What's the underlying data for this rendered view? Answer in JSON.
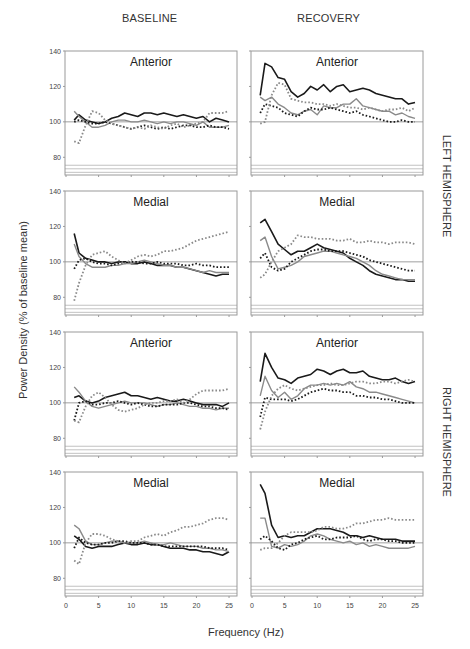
{
  "labels": {
    "col_baseline": "BASELINE",
    "col_recovery": "RECOVERY",
    "ylabel": "Power Density (% of baseline mean)",
    "xlabel": "Frequency (Hz)",
    "hemi_left": "LEFT HEMISPHERE",
    "hemi_right": "RIGHT HEMISPHERE"
  },
  "axes": {
    "y_ticks": [
      80,
      100,
      120,
      140
    ],
    "x_ticks": [
      0,
      5,
      10,
      15,
      20,
      25
    ],
    "ylim": [
      70,
      140
    ],
    "xlim": [
      0,
      26
    ],
    "reference_line": 100
  },
  "style": {
    "black": "#1a1a1a",
    "gray": "#8a8a8a",
    "frame": "#9a9a9a"
  },
  "chart_data": {
    "type": "line",
    "title": "",
    "xlabel": "Frequency (Hz)",
    "ylabel": "Power Density (% of baseline mean)",
    "ylim": [
      70,
      140
    ],
    "x": [
      1.25,
      2,
      3,
      4,
      5,
      6,
      7,
      8,
      9,
      10,
      11,
      12,
      13,
      14,
      15,
      16,
      17,
      18,
      19,
      20,
      21,
      22,
      23,
      24,
      25
    ],
    "series_styles": [
      {
        "name": "black-solid",
        "color": "#1a1a1a",
        "dash": false,
        "width": 1.6
      },
      {
        "name": "gray-solid",
        "color": "#8a8a8a",
        "dash": false,
        "width": 1.4
      },
      {
        "name": "black-dotted",
        "color": "#1a1a1a",
        "dash": true,
        "width": 1.8
      },
      {
        "name": "gray-dotted",
        "color": "#8a8a8a",
        "dash": true,
        "width": 1.8
      }
    ],
    "panels": [
      {
        "title": "Anterior",
        "hemisphere": "LEFT HEMISPHERE",
        "condition": "BASELINE",
        "series": [
          [
            101,
            104,
            101,
            100,
            99,
            100,
            102,
            103,
            105,
            104,
            103,
            105,
            105,
            104,
            105,
            104,
            103,
            104,
            103,
            102,
            103,
            100,
            102,
            101,
            100
          ],
          [
            106,
            103,
            100,
            97,
            97,
            98,
            100,
            101,
            101,
            100,
            100,
            101,
            100,
            99,
            100,
            99,
            100,
            100,
            99,
            98,
            100,
            97,
            97,
            97,
            98
          ],
          [
            100,
            101,
            100,
            99,
            99,
            100,
            99,
            98,
            97,
            96,
            97,
            98,
            97,
            96,
            97,
            96,
            97,
            98,
            98,
            97,
            97,
            98,
            97,
            97,
            96
          ],
          [
            89,
            88,
            98,
            106,
            105,
            101,
            99,
            98,
            97,
            96,
            97,
            96,
            98,
            97,
            96,
            98,
            99,
            97,
            98,
            99,
            100,
            105,
            105,
            105,
            106
          ]
        ]
      },
      {
        "title": "Anterior",
        "hemisphere": "LEFT HEMISPHERE",
        "condition": "RECOVERY",
        "series": [
          [
            115,
            133,
            131,
            125,
            124,
            117,
            114,
            116,
            120,
            118,
            121,
            117,
            120,
            121,
            117,
            118,
            119,
            118,
            116,
            115,
            114,
            113,
            113,
            110,
            111
          ],
          [
            114,
            112,
            114,
            110,
            108,
            105,
            104,
            106,
            107,
            104,
            109,
            108,
            108,
            110,
            110,
            113,
            109,
            108,
            107,
            106,
            106,
            104,
            105,
            103,
            102
          ],
          [
            105,
            110,
            109,
            108,
            105,
            104,
            103,
            106,
            108,
            107,
            107,
            108,
            107,
            106,
            105,
            106,
            104,
            103,
            102,
            101,
            100,
            100,
            101,
            100,
            100
          ],
          [
            99,
            100,
            115,
            122,
            121,
            113,
            112,
            111,
            111,
            110,
            110,
            109,
            110,
            109,
            108,
            108,
            107,
            108,
            107,
            106,
            107,
            107,
            108,
            106,
            108
          ]
        ]
      },
      {
        "title": "Medial",
        "hemisphere": "LEFT HEMISPHERE",
        "condition": "BASELINE",
        "series": [
          [
            116,
            105,
            102,
            101,
            100,
            100,
            99,
            100,
            100,
            99,
            99,
            100,
            99,
            98,
            98,
            98,
            97,
            97,
            96,
            95,
            94,
            93,
            92,
            93,
            93
          ],
          [
            110,
            103,
            99,
            97,
            97,
            97,
            98,
            98,
            99,
            99,
            100,
            101,
            100,
            99,
            98,
            98,
            97,
            97,
            96,
            95,
            94,
            95,
            94,
            94,
            94
          ],
          [
            96,
            101,
            102,
            100,
            99,
            99,
            98,
            99,
            100,
            100,
            100,
            99,
            99,
            100,
            99,
            99,
            99,
            98,
            98,
            99,
            98,
            98,
            97,
            97,
            97
          ],
          [
            78,
            88,
            98,
            104,
            105,
            106,
            103,
            101,
            99,
            101,
            103,
            104,
            103,
            104,
            106,
            106,
            107,
            108,
            110,
            112,
            113,
            114,
            115,
            116,
            117
          ]
        ]
      },
      {
        "title": "Medial",
        "hemisphere": "LEFT HEMISPHERE",
        "condition": "RECOVERY",
        "series": [
          [
            122,
            124,
            117,
            110,
            107,
            104,
            106,
            106,
            108,
            110,
            108,
            107,
            106,
            105,
            102,
            100,
            98,
            95,
            93,
            92,
            91,
            90,
            90,
            89,
            89
          ],
          [
            112,
            114,
            103,
            96,
            97,
            98,
            100,
            103,
            104,
            105,
            106,
            106,
            105,
            104,
            103,
            102,
            100,
            98,
            95,
            93,
            92,
            91,
            90,
            90,
            90
          ],
          [
            102,
            105,
            97,
            95,
            96,
            100,
            102,
            104,
            106,
            107,
            107,
            106,
            106,
            106,
            105,
            104,
            103,
            101,
            100,
            99,
            98,
            97,
            96,
            95,
            95
          ],
          [
            91,
            93,
            100,
            106,
            108,
            110,
            115,
            114,
            114,
            113,
            113,
            113,
            112,
            112,
            113,
            111,
            111,
            112,
            111,
            111,
            110,
            111,
            111,
            111,
            110
          ]
        ]
      },
      {
        "title": "Anterior",
        "hemisphere": "RIGHT HEMISPHERE",
        "condition": "BASELINE",
        "series": [
          [
            103,
            104,
            101,
            100,
            101,
            103,
            104,
            105,
            106,
            104,
            104,
            103,
            102,
            103,
            102,
            101,
            101,
            102,
            101,
            100,
            99,
            99,
            99,
            98,
            100
          ],
          [
            109,
            106,
            101,
            98,
            97,
            98,
            99,
            100,
            101,
            100,
            100,
            100,
            99,
            98,
            99,
            99,
            100,
            99,
            98,
            98,
            97,
            97,
            96,
            97,
            97
          ],
          [
            90,
            100,
            101,
            99,
            99,
            100,
            100,
            101,
            100,
            99,
            100,
            99,
            98,
            98,
            99,
            99,
            99,
            100,
            100,
            99,
            98,
            98,
            97,
            97,
            96
          ],
          [
            90,
            89,
            98,
            104,
            106,
            103,
            99,
            96,
            95,
            96,
            97,
            99,
            100,
            100,
            101,
            101,
            102,
            100,
            102,
            105,
            107,
            107,
            107,
            107,
            108
          ]
        ]
      },
      {
        "title": "Anterior",
        "hemisphere": "RIGHT HEMISPHERE",
        "condition": "RECOVERY",
        "series": [
          [
            112,
            128,
            120,
            114,
            113,
            111,
            114,
            115,
            116,
            119,
            118,
            116,
            118,
            119,
            117,
            117,
            118,
            115,
            114,
            113,
            113,
            114,
            112,
            111,
            112
          ],
          [
            104,
            115,
            107,
            103,
            106,
            102,
            104,
            108,
            110,
            110,
            111,
            110,
            111,
            110,
            112,
            109,
            108,
            106,
            106,
            105,
            104,
            103,
            102,
            101,
            100
          ],
          [
            92,
            103,
            102,
            102,
            102,
            101,
            102,
            104,
            106,
            107,
            108,
            107,
            107,
            106,
            106,
            104,
            104,
            103,
            103,
            102,
            102,
            101,
            100,
            100,
            100
          ],
          [
            85,
            95,
            104,
            108,
            110,
            108,
            107,
            108,
            109,
            110,
            110,
            111,
            110,
            110,
            111,
            112,
            112,
            111,
            111,
            112,
            112,
            111,
            112,
            113,
            112
          ]
        ]
      },
      {
        "title": "Medial",
        "hemisphere": "RIGHT HEMISPHERE",
        "condition": "BASELINE",
        "series": [
          [
            104,
            102,
            98,
            97,
            98,
            98,
            98,
            99,
            100,
            99,
            99,
            100,
            99,
            99,
            98,
            97,
            97,
            97,
            96,
            96,
            95,
            95,
            94,
            93,
            95
          ],
          [
            110,
            108,
            101,
            99,
            99,
            100,
            101,
            101,
            100,
            100,
            100,
            101,
            100,
            99,
            99,
            100,
            99,
            98,
            98,
            98,
            97,
            97,
            96,
            96,
            95
          ],
          [
            97,
            103,
            100,
            99,
            99,
            100,
            100,
            101,
            101,
            100,
            100,
            100,
            99,
            99,
            98,
            98,
            98,
            98,
            98,
            98,
            98,
            97,
            97,
            97,
            96
          ],
          [
            90,
            88,
            100,
            105,
            105,
            104,
            102,
            101,
            100,
            101,
            101,
            103,
            104,
            105,
            104,
            106,
            107,
            109,
            109,
            110,
            111,
            113,
            114,
            114,
            113
          ]
        ]
      },
      {
        "title": "Medial",
        "hemisphere": "RIGHT HEMISPHERE",
        "condition": "RECOVERY",
        "series": [
          [
            133,
            128,
            110,
            103,
            104,
            103,
            104,
            104,
            106,
            108,
            108,
            108,
            107,
            106,
            104,
            104,
            103,
            104,
            103,
            102,
            102,
            102,
            101,
            101,
            101
          ],
          [
            114,
            114,
            98,
            97,
            99,
            98,
            99,
            101,
            104,
            105,
            104,
            102,
            101,
            100,
            101,
            99,
            100,
            98,
            99,
            98,
            97,
            97,
            97,
            97,
            98
          ],
          [
            102,
            104,
            101,
            97,
            96,
            99,
            100,
            102,
            103,
            104,
            102,
            102,
            103,
            103,
            103,
            104,
            102,
            101,
            102,
            102,
            101,
            101,
            100,
            100,
            100
          ],
          [
            96,
            97,
            97,
            100,
            104,
            106,
            106,
            106,
            106,
            107,
            109,
            109,
            108,
            108,
            109,
            111,
            111,
            112,
            113,
            113,
            114,
            113,
            113,
            113,
            113
          ]
        ]
      }
    ]
  }
}
